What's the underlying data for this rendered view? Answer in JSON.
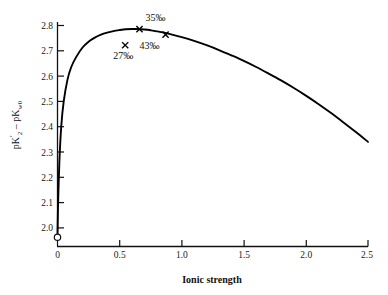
{
  "chart_data": {
    "type": "line",
    "title": "",
    "xlabel": "Ionic strength",
    "ylabel": "pK'2 - pKw0",
    "ylabel_parts": {
      "first_base": "pK",
      "first_prime": "′",
      "first_sub": "2",
      "operator": "–",
      "second_base": "pK",
      "second_sub": "w0"
    },
    "xlim": [
      0,
      2.5
    ],
    "ylim": [
      1.95,
      2.82
    ],
    "grid": false,
    "legend": "none",
    "xticks": [
      "0",
      "0.5",
      "1.0",
      "1.5",
      "2.0",
      "2.5"
    ],
    "xtick_values": [
      0,
      0.5,
      1.0,
      1.5,
      2.0,
      2.5
    ],
    "yticks": [
      "2.0",
      "2.1",
      "2.2",
      "2.3",
      "2.4",
      "2.5",
      "2.6",
      "2.7",
      "2.8"
    ],
    "ytick_values": [
      2.0,
      2.1,
      2.2,
      2.3,
      2.4,
      2.5,
      2.6,
      2.7,
      2.8
    ],
    "series": [
      {
        "name": "pK'2 - pKw0 vs ionic strength",
        "style": "solid-curve",
        "color": "#000000",
        "x": [
          0.0,
          0.005,
          0.015,
          0.03,
          0.05,
          0.08,
          0.11,
          0.15,
          0.2,
          0.25,
          0.3,
          0.35,
          0.4,
          0.45,
          0.5,
          0.55,
          0.6,
          0.65,
          0.7,
          0.75,
          0.8,
          0.9,
          1.0,
          1.1,
          1.2,
          1.3,
          1.4,
          1.5,
          1.6,
          1.7,
          1.8,
          1.9,
          2.0,
          2.1,
          2.2,
          2.3,
          2.4,
          2.5
        ],
        "y": [
          1.97,
          2.1,
          2.26,
          2.4,
          2.5,
          2.585,
          2.635,
          2.675,
          2.712,
          2.736,
          2.752,
          2.764,
          2.772,
          2.778,
          2.782,
          2.785,
          2.786,
          2.786,
          2.784,
          2.781,
          2.777,
          2.767,
          2.754,
          2.739,
          2.722,
          2.703,
          2.682,
          2.66,
          2.636,
          2.61,
          2.583,
          2.554,
          2.523,
          2.49,
          2.455,
          2.418,
          2.38,
          2.34
        ]
      }
    ],
    "points": [
      {
        "label": "35",
        "label_suffix": "‰",
        "marker": "x",
        "x": 0.66,
        "y": 2.786,
        "label_dx": 6,
        "label_dy": -8
      },
      {
        "label": "43",
        "label_suffix": "‰",
        "marker": "x",
        "x": 0.87,
        "y": 2.764,
        "label_dx": -26,
        "label_dy": 14
      },
      {
        "label": "27",
        "label_suffix": "‰",
        "marker": "x",
        "x": 0.545,
        "y": 2.722,
        "label_dx": -12,
        "label_dy": 14
      },
      {
        "label": "",
        "label_suffix": "",
        "marker": "open-circle",
        "x": 0.0,
        "y": 1.963,
        "label_dx": 0,
        "label_dy": 0
      }
    ],
    "annotations": [
      {
        "text": "35‰",
        "x": 0.66,
        "y": 2.786
      },
      {
        "text": "43‰",
        "x": 0.87,
        "y": 2.764
      },
      {
        "text": "27‰",
        "x": 0.545,
        "y": 2.722
      }
    ],
    "axis_note": "y axis truncated below 2.0; open circle marks freshwater value at zero ionic strength"
  }
}
